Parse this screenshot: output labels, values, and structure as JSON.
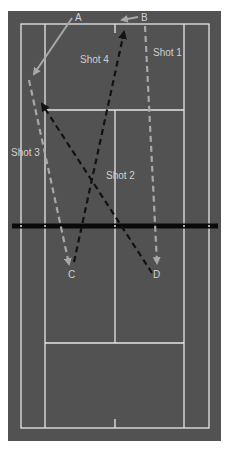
{
  "diagram": {
    "type": "tennis-court-shot-diagram",
    "colors": {
      "surround": "#525252",
      "court": "#4d4d4d",
      "lines": "#e6e6e6",
      "net": "#0a0a0a",
      "gray_shot": "#a8a8a8",
      "black_shot": "#121212",
      "label": "#cfcfcf"
    },
    "points": {
      "A": {
        "label": "A"
      },
      "B": {
        "label": "B"
      },
      "C": {
        "label": "C"
      },
      "D": {
        "label": "D"
      }
    },
    "shots": [
      {
        "label": "Shot 1",
        "color": "gray",
        "style": "dashed",
        "from": "B",
        "to": "D"
      },
      {
        "label": "Shot 2",
        "color": "black",
        "style": "dashed",
        "from": "D",
        "to": "left side near service line"
      },
      {
        "label": "Shot 3",
        "color": "gray",
        "style": "dashed",
        "from": "left sideline",
        "to": "C"
      },
      {
        "label": "Shot 4",
        "color": "black",
        "style": "dashed",
        "from": "C",
        "to": "B"
      }
    ],
    "player_moves": [
      {
        "from": "A",
        "to": "left sideline",
        "color": "gray",
        "style": "solid"
      },
      {
        "from": "B",
        "to": "center baseline",
        "color": "gray",
        "style": "solid"
      }
    ]
  }
}
